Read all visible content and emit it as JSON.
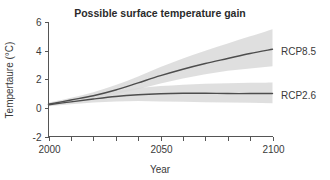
{
  "chart_data": {
    "type": "line",
    "title": "Possible surface temperature gain",
    "xlabel": "Year",
    "ylabel": "Tempertaure (°C)",
    "xlim": [
      2000,
      2100
    ],
    "ylim": [
      -2,
      6
    ],
    "yticks": [
      -2,
      0,
      2,
      4,
      6
    ],
    "ytick_labels": [
      "-2",
      "0",
      "2",
      "4",
      "6"
    ],
    "xticks": [
      2000,
      2010,
      2020,
      2030,
      2040,
      2050,
      2060,
      2070,
      2080,
      2090,
      2100
    ],
    "xtick_labels": [
      "2000",
      "",
      "",
      "",
      "",
      "2050",
      "",
      "",
      "",
      "",
      "2100"
    ],
    "grid": false,
    "legend_position": "right-inline",
    "x": [
      2000,
      2010,
      2020,
      2030,
      2040,
      2050,
      2060,
      2070,
      2080,
      2090,
      2100
    ],
    "series": [
      {
        "name": "RCP8.5",
        "label": "RCP8.5",
        "color": "#4d4d4d",
        "values": [
          0.25,
          0.55,
          0.85,
          1.25,
          1.75,
          2.25,
          2.7,
          3.1,
          3.45,
          3.8,
          4.1
        ],
        "band_low": [
          0.15,
          0.4,
          0.65,
          0.95,
          1.3,
          1.7,
          2.05,
          2.35,
          2.6,
          2.75,
          2.9
        ],
        "band_high": [
          0.35,
          0.7,
          1.1,
          1.6,
          2.2,
          2.85,
          3.45,
          4.0,
          4.5,
          5.0,
          5.5
        ],
        "band_color": "#d9d9d9"
      },
      {
        "name": "RCP2.6",
        "label": "RCP2.6",
        "color": "#4d4d4d",
        "values": [
          0.22,
          0.42,
          0.62,
          0.8,
          0.92,
          0.99,
          1.02,
          1.02,
          1.0,
          1.0,
          1.0
        ],
        "band_low": [
          0.12,
          0.25,
          0.38,
          0.45,
          0.48,
          0.45,
          0.42,
          0.4,
          0.38,
          0.35,
          0.33
        ],
        "band_high": [
          0.32,
          0.6,
          0.9,
          1.15,
          1.38,
          1.52,
          1.62,
          1.68,
          1.72,
          1.75,
          1.78
        ],
        "band_color": "#d9d9d9"
      }
    ]
  },
  "labels": {
    "title": "Possible surface temperature gain",
    "xlabel": "Year",
    "ylabel": "Tempertaure (°C)",
    "series_top": "RCP8.5",
    "series_bottom": "RCP2.6"
  }
}
